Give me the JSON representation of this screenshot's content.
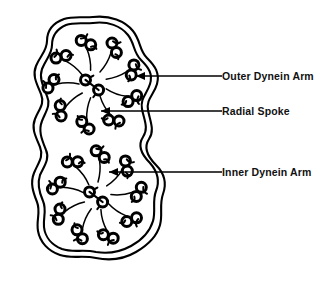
{
  "figure": {
    "background_color": "#ffffff",
    "ink_color": "#000000",
    "width": 335,
    "height": 295
  },
  "labels": [
    {
      "id": "outer-dynein-arm",
      "text": "Outer Dynein Arm",
      "text_x": 222,
      "text_y": 71,
      "leader_from_x": 222,
      "leader_to_x": 136,
      "leader_y": 76,
      "arrow_target_x": 136,
      "arrow_target_y": 76
    },
    {
      "id": "radial-spoke",
      "text": "Radial Spoke",
      "text_x": 222,
      "text_y": 106,
      "leader_from_x": 222,
      "leader_to_x": 101,
      "leader_y": 111,
      "arrow_target_x": 101,
      "arrow_target_y": 111
    },
    {
      "id": "inner-dynein-arm",
      "text": "Inner Dynein Arm",
      "text_x": 222,
      "text_y": 167,
      "leader_from_x": 222,
      "leader_to_x": 109,
      "leader_y": 172,
      "arrow_target_x": 109,
      "arrow_target_y": 172
    }
  ],
  "structure": {
    "membrane": {
      "name": "ciliary-membrane",
      "style": "double wavy outline enclosing both axonemes"
    },
    "axonemes": [
      {
        "id": "upper-axoneme",
        "center_x": 93,
        "center_y": 84,
        "doublet_ring_radius": 44,
        "doublet_count": 9,
        "central_pair_count": 2,
        "angle_offset_deg": -100
      },
      {
        "id": "lower-axoneme",
        "center_x": 97,
        "center_y": 196,
        "doublet_ring_radius": 44,
        "doublet_count": 9,
        "central_pair_count": 2,
        "angle_offset_deg": -86
      }
    ]
  }
}
